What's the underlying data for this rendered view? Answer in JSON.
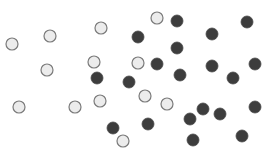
{
  "canvas": {
    "width": 268,
    "height": 160,
    "background": "#ffffff"
  },
  "styles": {
    "light": {
      "fill": "#ececec",
      "stroke": "#7a7a7a",
      "radius": 6
    },
    "dark": {
      "fill": "#3d3d3d",
      "stroke": "#4a4a4a",
      "radius": 6
    }
  },
  "dots": [
    {
      "type": "light",
      "x": 12,
      "y": 44
    },
    {
      "type": "light",
      "x": 50,
      "y": 36
    },
    {
      "type": "light",
      "x": 101,
      "y": 28
    },
    {
      "type": "light",
      "x": 157,
      "y": 18
    },
    {
      "type": "light",
      "x": 47,
      "y": 70
    },
    {
      "type": "light",
      "x": 94,
      "y": 62
    },
    {
      "type": "light",
      "x": 138,
      "y": 63
    },
    {
      "type": "light",
      "x": 19,
      "y": 107
    },
    {
      "type": "light",
      "x": 75,
      "y": 107
    },
    {
      "type": "light",
      "x": 100,
      "y": 101
    },
    {
      "type": "light",
      "x": 145,
      "y": 96
    },
    {
      "type": "light",
      "x": 167,
      "y": 104
    },
    {
      "type": "light",
      "x": 123,
      "y": 141
    },
    {
      "type": "dark",
      "x": 177,
      "y": 21
    },
    {
      "type": "dark",
      "x": 247,
      "y": 22
    },
    {
      "type": "dark",
      "x": 138,
      "y": 37
    },
    {
      "type": "dark",
      "x": 212,
      "y": 34
    },
    {
      "type": "dark",
      "x": 177,
      "y": 48
    },
    {
      "type": "dark",
      "x": 157,
      "y": 64
    },
    {
      "type": "dark",
      "x": 212,
      "y": 66
    },
    {
      "type": "dark",
      "x": 255,
      "y": 64
    },
    {
      "type": "dark",
      "x": 97,
      "y": 78
    },
    {
      "type": "dark",
      "x": 129,
      "y": 82
    },
    {
      "type": "dark",
      "x": 180,
      "y": 75
    },
    {
      "type": "dark",
      "x": 233,
      "y": 78
    },
    {
      "type": "dark",
      "x": 203,
      "y": 109
    },
    {
      "type": "dark",
      "x": 220,
      "y": 114
    },
    {
      "type": "dark",
      "x": 190,
      "y": 119
    },
    {
      "type": "dark",
      "x": 255,
      "y": 107
    },
    {
      "type": "dark",
      "x": 113,
      "y": 128
    },
    {
      "type": "dark",
      "x": 148,
      "y": 124
    },
    {
      "type": "dark",
      "x": 193,
      "y": 140
    },
    {
      "type": "dark",
      "x": 242,
      "y": 136
    }
  ]
}
